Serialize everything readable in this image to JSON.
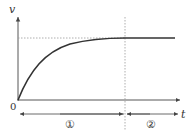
{
  "diagram": {
    "type": "velocity-time graph",
    "axes": {
      "y_label": "v",
      "x_label": "t",
      "origin_label": "0"
    },
    "curve": {
      "description": "velocity rises from 0 and asymptotically approaches a terminal value, then stays constant",
      "color": "#333333"
    },
    "guide_lines": {
      "horizontal_dashed": "terminal velocity level",
      "vertical_dashed": "boundary between phases"
    },
    "phases": [
      {
        "label": "①",
        "description": "accelerating phase"
      },
      {
        "label": "②",
        "description": "constant velocity phase"
      }
    ]
  }
}
